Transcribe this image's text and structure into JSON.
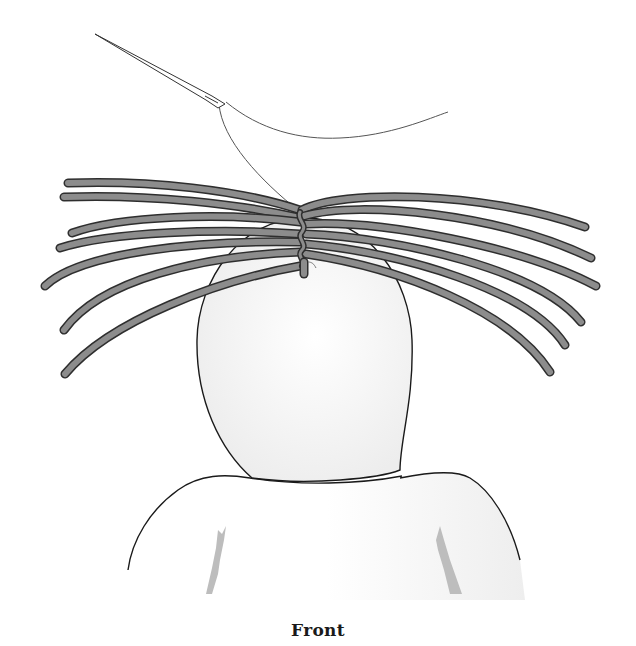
{
  "figure": {
    "caption": "Front",
    "colors": {
      "strand_fill": "#8c8c8c",
      "strand_outline": "#2e2e2e",
      "head_fill": "#f2f2f2",
      "outline": "#1a1a1a",
      "shadow": "#bdbdbd",
      "thread": "#555555"
    },
    "elements": [
      "needle",
      "thread",
      "hair-strands-left",
      "hair-strands-right",
      "head-form",
      "shoulders"
    ]
  }
}
